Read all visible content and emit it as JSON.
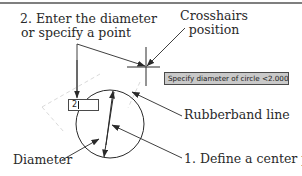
{
  "diagram": {
    "callouts": {
      "step2_line1": "2. Enter the diameter",
      "step2_line2": "or specify a point",
      "crosshairs_line1": "Crosshairs",
      "crosshairs_line2": "position",
      "rubberband": "Rubberband line",
      "diameter": "Diameter",
      "step1": "1. Define a center point"
    },
    "prompt_tooltip": {
      "text": "Specify diameter of circle <2.0000>:"
    },
    "dynamic_input": {
      "value": "2"
    },
    "colors": {
      "line": "#2a2a2a",
      "tooltip_bg": "#c9c9c9",
      "dashed": "#c8c8c8"
    }
  }
}
